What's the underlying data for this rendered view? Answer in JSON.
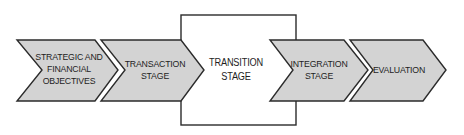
{
  "diagram": {
    "type": "process-flow",
    "colors": {
      "chevron_fill": "#d3d3d3",
      "outline": "#2b2b2b",
      "box_fill": "#ffffff",
      "text": "#1e1e1e"
    },
    "stages": [
      {
        "shape": "chevron",
        "lines": [
          "STRATEGIC AND",
          "FINANCIAL",
          "OBJECTIVES"
        ]
      },
      {
        "shape": "chevron",
        "lines": [
          "TRANSACTION",
          "STAGE"
        ]
      },
      {
        "shape": "rectangle",
        "lines": [
          "TRANSITION",
          "STAGE"
        ]
      },
      {
        "shape": "chevron",
        "lines": [
          "INTEGRATION",
          "STAGE"
        ]
      },
      {
        "shape": "chevron",
        "lines": [
          "EVALUATION"
        ]
      }
    ]
  }
}
